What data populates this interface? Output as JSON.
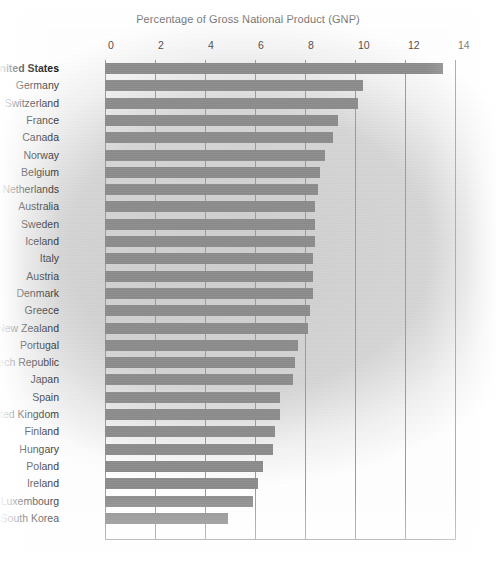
{
  "chart_data": {
    "type": "bar",
    "orientation": "horizontal",
    "title": "Percentage of Gross National Product (GNP)",
    "xlabel": "",
    "ylabel": "",
    "xlim": [
      0,
      14
    ],
    "xticks": [
      0,
      2,
      4,
      6,
      8,
      10,
      12,
      14
    ],
    "grid": true,
    "legend": "none",
    "highlight_category": "United States",
    "bar_color": "#8b8b8b",
    "background_color": "#cdcdcd",
    "gridline_color": "#9a9a9a",
    "categories": [
      "United States",
      "Germany",
      "Switzerland",
      "France",
      "Canada",
      "Norway",
      "Belgium",
      "Netherlands",
      "Australia",
      "Sweden",
      "Iceland",
      "Italy",
      "Austria",
      "Denmark",
      "Greece",
      "New Zealand",
      "Portugal",
      "Czech Republic",
      "Japan",
      "Spain",
      "United Kingdom",
      "Finland",
      "Hungary",
      "Poland",
      "Ireland",
      "Luxembourg",
      "South Korea"
    ],
    "values": [
      13.5,
      10.3,
      10.1,
      9.3,
      9.1,
      8.8,
      8.6,
      8.5,
      8.4,
      8.4,
      8.4,
      8.3,
      8.3,
      8.3,
      8.2,
      8.1,
      7.7,
      7.6,
      7.5,
      7.0,
      7.0,
      6.8,
      6.7,
      6.3,
      6.1,
      5.9,
      4.9
    ]
  }
}
